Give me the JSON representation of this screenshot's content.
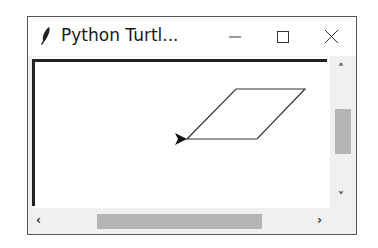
{
  "window": {
    "title": "Python Turtl...",
    "app_icon": "feather-icon",
    "controls": {
      "minimize": "minimize-icon",
      "maximize": "maximize-icon",
      "close": "close-icon"
    }
  },
  "canvas": {
    "shape": "parallelogram",
    "points": [
      [
        186,
        138
      ],
      [
        235,
        88
      ],
      [
        304,
        88
      ],
      [
        256,
        138
      ]
    ],
    "turtle": {
      "shape": "arrow",
      "heading": "east",
      "x": 186,
      "y": 138
    },
    "stroke_color": "#333333"
  },
  "scrollbars": {
    "vertical": {
      "up_icon": "chevron-up-icon",
      "down_icon": "chevron-down-icon"
    },
    "horizontal": {
      "left_icon": "chevron-left-icon",
      "right_icon": "chevron-right-icon"
    }
  },
  "colors": {
    "thumb": "#b5b5b5",
    "track": "#f0f0f0",
    "border": "#222222"
  }
}
